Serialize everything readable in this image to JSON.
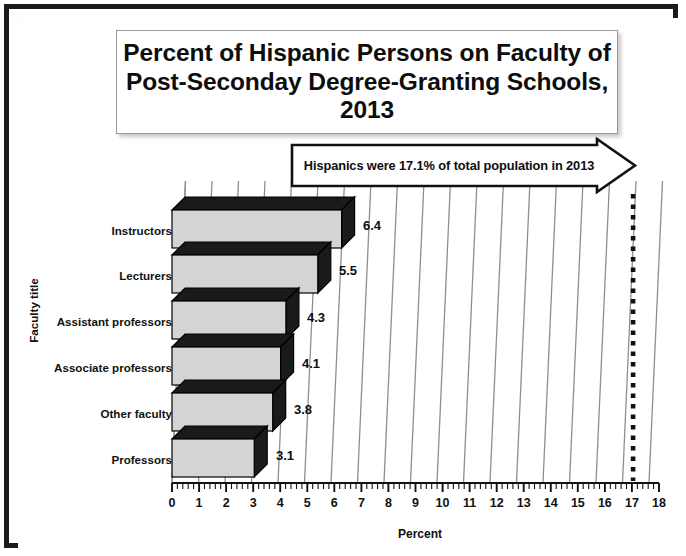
{
  "title": "Percent of Hispanic Persons on Faculty of Post-Seconday Degree-Granting Schools, 2013",
  "callout": {
    "text": "Hispanics were 17.1% of total population in 2013",
    "reference_value": 17.1,
    "shape": "right-arrow-banner",
    "marker": "dotted-vertical-line"
  },
  "colors": {
    "bar_front": "#d4d4d4",
    "bar_shade": "#1a1a1a",
    "outline": "#000000",
    "frame": "#1b1b1b",
    "gridline": "#8c8c8c",
    "text": "#111111",
    "background": "#ffffff"
  },
  "chart_data": {
    "type": "bar",
    "orientation": "horizontal",
    "style": "3d",
    "title": "Percent of Hispanic Persons on Faculty of Post-Seconday Degree-Granting Schools, 2013",
    "xlabel": "Percent",
    "ylabel": "Faculty title",
    "categories": [
      "Instructors",
      "Lecturers",
      "Assistant professors",
      "Associate professors",
      "Other faculty",
      "Professors"
    ],
    "values": [
      6.4,
      5.5,
      4.3,
      4.1,
      3.8,
      3.1
    ],
    "data_labels": [
      "6.4",
      "5.5",
      "4.3",
      "4.1",
      "3.8",
      "3.1"
    ],
    "xlim": [
      0,
      18
    ],
    "xticks": [
      0,
      1,
      2,
      3,
      4,
      5,
      6,
      7,
      8,
      9,
      10,
      11,
      12,
      13,
      14,
      15,
      16,
      17,
      18
    ],
    "xtick_labels": [
      "0",
      "1",
      "2",
      "3",
      "4",
      "5",
      "6",
      "7",
      "8",
      "9",
      "10",
      "11",
      "12",
      "13",
      "14",
      "15",
      "16",
      "17",
      "18"
    ],
    "minor_ticks_per_interval": 5,
    "grid": true,
    "grid_axis": "x",
    "legend": false,
    "annotations": [
      {
        "text": "Hispanics were 17.1% of total population in 2013",
        "value": 17.1,
        "type": "reference-line-callout"
      }
    ]
  }
}
